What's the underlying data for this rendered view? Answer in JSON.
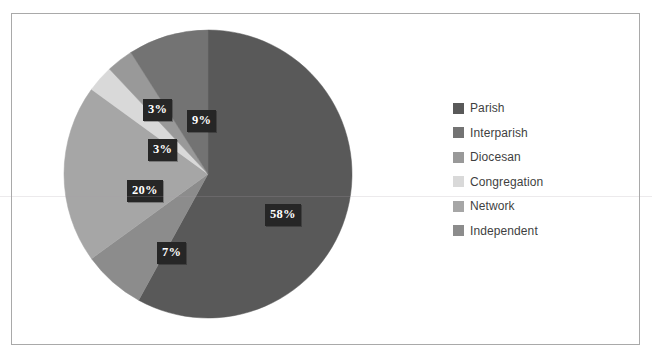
{
  "frame": {
    "border_color": "#a9a9a9",
    "background": "#ffffff"
  },
  "clipped_top_text": "",
  "legend": {
    "position": "right",
    "items": [
      {
        "label": "Parish",
        "color": "#595959"
      },
      {
        "label": "Interparish",
        "color": "#737373"
      },
      {
        "label": "Diocesan",
        "color": "#999999"
      },
      {
        "label": "Congregation",
        "color": "#d9d9d9"
      },
      {
        "label": "Network",
        "color": "#a6a6a6"
      },
      {
        "label": "Independent",
        "color": "#8c8c8c"
      }
    ]
  },
  "pie": {
    "center_x": 145,
    "center_y": 145,
    "radius": 144,
    "start_angle_deg": 0,
    "direction": "clockwise"
  },
  "labels": [
    {
      "text": "58%",
      "left": 253,
      "top": 190
    },
    {
      "text": "7%",
      "left": 145,
      "top": 228
    },
    {
      "text": "20%",
      "left": 115,
      "top": 166
    },
    {
      "text": "3%",
      "left": 136,
      "top": 125
    },
    {
      "text": "3%",
      "left": 131,
      "top": 85
    },
    {
      "text": "9%",
      "left": 175,
      "top": 96
    }
  ],
  "chart_data": {
    "type": "pie",
    "title": "",
    "categories": [
      "Parish",
      "Interparish",
      "Diocesan",
      "Congregation",
      "Network",
      "Independent"
    ],
    "values": [
      58,
      9,
      3,
      3,
      20,
      7
    ],
    "value_labels": [
      "58%",
      "9%",
      "3%",
      "3%",
      "20%",
      "7%"
    ],
    "unit": "percent",
    "colors": [
      "#595959",
      "#737373",
      "#999999",
      "#d9d9d9",
      "#a6a6a6",
      "#8c8c8c"
    ],
    "legend_position": "right",
    "grid": false,
    "slice_order_clockwise_from_12": [
      "Parish",
      "Independent",
      "Network",
      "Congregation",
      "Diocesan",
      "Interparish"
    ],
    "xlabel": "",
    "ylabel": ""
  }
}
